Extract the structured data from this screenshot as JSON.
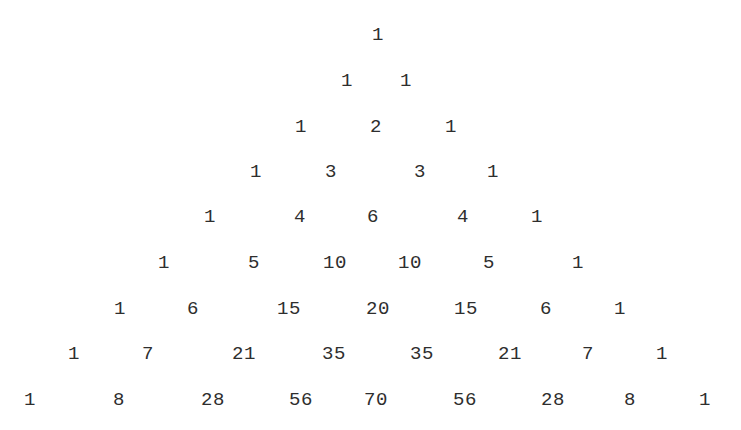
{
  "figure": {
    "text_color": "#2e2e2e",
    "background": "#ffffff",
    "rows": [
      {
        "y": 35,
        "cells": [
          {
            "v": "1",
            "x": 378
          }
        ]
      },
      {
        "y": 81,
        "cells": [
          {
            "v": "1",
            "x": 347
          },
          {
            "v": "1",
            "x": 406
          }
        ]
      },
      {
        "y": 127,
        "cells": [
          {
            "v": "1",
            "x": 301
          },
          {
            "v": "2",
            "x": 376
          },
          {
            "v": "1",
            "x": 451
          }
        ]
      },
      {
        "y": 172,
        "cells": [
          {
            "v": "1",
            "x": 256
          },
          {
            "v": "3",
            "x": 331
          },
          {
            "v": "3",
            "x": 420
          },
          {
            "v": "1",
            "x": 493
          }
        ]
      },
      {
        "y": 217,
        "cells": [
          {
            "v": "1",
            "x": 210
          },
          {
            "v": "4",
            "x": 300
          },
          {
            "v": "6",
            "x": 373
          },
          {
            "v": "4",
            "x": 463
          },
          {
            "v": "1",
            "x": 537
          }
        ]
      },
      {
        "y": 263,
        "cells": [
          {
            "v": "1",
            "x": 164
          },
          {
            "v": "5",
            "x": 254
          },
          {
            "v": "10",
            "x": 335
          },
          {
            "v": "10",
            "x": 410
          },
          {
            "v": "5",
            "x": 489
          },
          {
            "v": "1",
            "x": 578
          }
        ]
      },
      {
        "y": 309,
        "cells": [
          {
            "v": "1",
            "x": 120
          },
          {
            "v": "6",
            "x": 193
          },
          {
            "v": "15",
            "x": 289
          },
          {
            "v": "20",
            "x": 378
          },
          {
            "v": "15",
            "x": 466
          },
          {
            "v": "6",
            "x": 546
          },
          {
            "v": "1",
            "x": 620
          }
        ]
      },
      {
        "y": 354,
        "cells": [
          {
            "v": "1",
            "x": 74
          },
          {
            "v": "7",
            "x": 148
          },
          {
            "v": "21",
            "x": 244
          },
          {
            "v": "35",
            "x": 334
          },
          {
            "v": "35",
            "x": 422
          },
          {
            "v": "21",
            "x": 510
          },
          {
            "v": "7",
            "x": 588
          },
          {
            "v": "1",
            "x": 662
          }
        ]
      },
      {
        "y": 400,
        "cells": [
          {
            "v": "1",
            "x": 30
          },
          {
            "v": "8",
            "x": 119
          },
          {
            "v": "28",
            "x": 213
          },
          {
            "v": "56",
            "x": 301
          },
          {
            "v": "70",
            "x": 376
          },
          {
            "v": "56",
            "x": 465
          },
          {
            "v": "28",
            "x": 553
          },
          {
            "v": "8",
            "x": 630
          },
          {
            "v": "1",
            "x": 705
          }
        ]
      }
    ]
  }
}
